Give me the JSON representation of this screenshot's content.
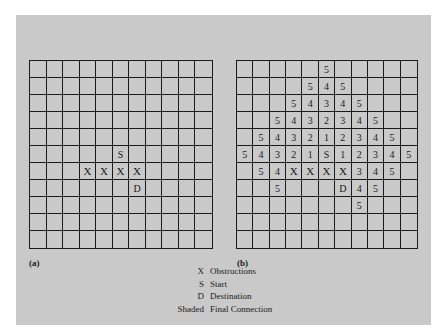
{
  "figure": {
    "panels": [
      {
        "label": "(a)",
        "rows": 11,
        "cols": 11,
        "cells": [
          {
            "r": 5,
            "c": 5,
            "v": "S"
          },
          {
            "r": 6,
            "c": 3,
            "v": "X"
          },
          {
            "r": 6,
            "c": 4,
            "v": "X"
          },
          {
            "r": 6,
            "c": 5,
            "v": "X"
          },
          {
            "r": 6,
            "c": 6,
            "v": "X"
          },
          {
            "r": 7,
            "c": 6,
            "v": "D"
          }
        ]
      },
      {
        "label": "(b)",
        "rows": 11,
        "cols": 11,
        "cells": [
          {
            "r": 0,
            "c": 5,
            "v": "5"
          },
          {
            "r": 1,
            "c": 4,
            "v": "5"
          },
          {
            "r": 1,
            "c": 5,
            "v": "4"
          },
          {
            "r": 1,
            "c": 6,
            "v": "5"
          },
          {
            "r": 2,
            "c": 3,
            "v": "5"
          },
          {
            "r": 2,
            "c": 4,
            "v": "4"
          },
          {
            "r": 2,
            "c": 5,
            "v": "3"
          },
          {
            "r": 2,
            "c": 6,
            "v": "4"
          },
          {
            "r": 2,
            "c": 7,
            "v": "5"
          },
          {
            "r": 3,
            "c": 2,
            "v": "5"
          },
          {
            "r": 3,
            "c": 3,
            "v": "4"
          },
          {
            "r": 3,
            "c": 4,
            "v": "3"
          },
          {
            "r": 3,
            "c": 5,
            "v": "2"
          },
          {
            "r": 3,
            "c": 6,
            "v": "3"
          },
          {
            "r": 3,
            "c": 7,
            "v": "4"
          },
          {
            "r": 3,
            "c": 8,
            "v": "5"
          },
          {
            "r": 4,
            "c": 1,
            "v": "5"
          },
          {
            "r": 4,
            "c": 2,
            "v": "4"
          },
          {
            "r": 4,
            "c": 3,
            "v": "3"
          },
          {
            "r": 4,
            "c": 4,
            "v": "2"
          },
          {
            "r": 4,
            "c": 5,
            "v": "1"
          },
          {
            "r": 4,
            "c": 6,
            "v": "2"
          },
          {
            "r": 4,
            "c": 7,
            "v": "3"
          },
          {
            "r": 4,
            "c": 8,
            "v": "4"
          },
          {
            "r": 4,
            "c": 9,
            "v": "5"
          },
          {
            "r": 5,
            "c": 0,
            "v": "5"
          },
          {
            "r": 5,
            "c": 1,
            "v": "4"
          },
          {
            "r": 5,
            "c": 2,
            "v": "3"
          },
          {
            "r": 5,
            "c": 3,
            "v": "2"
          },
          {
            "r": 5,
            "c": 4,
            "v": "1"
          },
          {
            "r": 5,
            "c": 5,
            "v": "S"
          },
          {
            "r": 5,
            "c": 6,
            "v": "1"
          },
          {
            "r": 5,
            "c": 7,
            "v": "2"
          },
          {
            "r": 5,
            "c": 8,
            "v": "3"
          },
          {
            "r": 5,
            "c": 9,
            "v": "4"
          },
          {
            "r": 5,
            "c": 10,
            "v": "5"
          },
          {
            "r": 6,
            "c": 1,
            "v": "5"
          },
          {
            "r": 6,
            "c": 2,
            "v": "4"
          },
          {
            "r": 6,
            "c": 3,
            "v": "X"
          },
          {
            "r": 6,
            "c": 4,
            "v": "X"
          },
          {
            "r": 6,
            "c": 5,
            "v": "X"
          },
          {
            "r": 6,
            "c": 6,
            "v": "X"
          },
          {
            "r": 6,
            "c": 7,
            "v": "3"
          },
          {
            "r": 6,
            "c": 8,
            "v": "4"
          },
          {
            "r": 6,
            "c": 9,
            "v": "5"
          },
          {
            "r": 7,
            "c": 2,
            "v": "5"
          },
          {
            "r": 7,
            "c": 6,
            "v": "D"
          },
          {
            "r": 7,
            "c": 7,
            "v": "4"
          },
          {
            "r": 7,
            "c": 8,
            "v": "5"
          },
          {
            "r": 8,
            "c": 7,
            "v": "5"
          }
        ]
      }
    ],
    "legend": [
      {
        "symbol": "X",
        "text": "Obstructions"
      },
      {
        "symbol": "S",
        "text": "Start"
      },
      {
        "symbol": "D",
        "text": "Destination"
      },
      {
        "symbol": "Shaded",
        "text": "Final Connection"
      }
    ]
  }
}
